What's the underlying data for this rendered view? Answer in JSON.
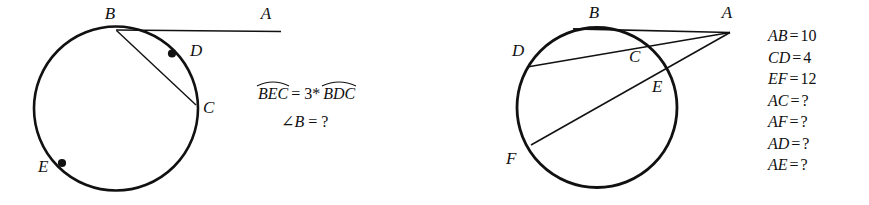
{
  "figure": {
    "background_color": "#ffffff",
    "stroke_color": "#111111",
    "left_figure": {
      "name": "tangent-chord-circle",
      "labels": {
        "A": "A",
        "B": "B",
        "C": "C",
        "D": "D",
        "E": "E"
      },
      "given": {
        "arc_1": "BEC",
        "relation": "= 3*",
        "arc_2": "BDC",
        "question_angle": "∠B",
        "question_equals": "= ?"
      }
    },
    "right_figure": {
      "name": "secants-from-external-point-circle",
      "labels": {
        "A": "A",
        "B": "B",
        "C": "C",
        "D": "D",
        "E": "E",
        "F": "F"
      },
      "measurements": [
        {
          "name": "AB",
          "eq": "=",
          "value": "10"
        },
        {
          "name": "CD",
          "eq": "=",
          "value": "4"
        },
        {
          "name": "EF",
          "eq": "=",
          "value": "12"
        },
        {
          "name": "AC",
          "eq": "=",
          "value": "?"
        },
        {
          "name": "AF",
          "eq": "=",
          "value": "?"
        },
        {
          "name": "AD",
          "eq": "=",
          "value": "?"
        },
        {
          "name": "AE",
          "eq": "=",
          "value": "?"
        }
      ]
    }
  }
}
